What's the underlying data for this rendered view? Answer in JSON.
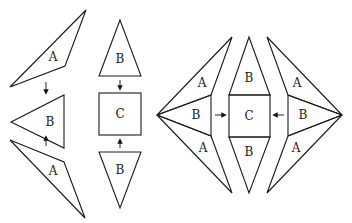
{
  "diagram": {
    "type": "quilt-block-assembly",
    "left_panel": {
      "column_1": [
        {
          "shape": "triangle",
          "label": "A"
        },
        {
          "arrow": "down"
        },
        {
          "shape": "triangle",
          "label": "B"
        },
        {
          "arrow": "up"
        },
        {
          "shape": "triangle",
          "label": "A"
        }
      ],
      "column_2": [
        {
          "shape": "triangle",
          "label": "B"
        },
        {
          "arrow": "down"
        },
        {
          "shape": "square",
          "label": "C"
        },
        {
          "arrow": "up"
        },
        {
          "shape": "triangle",
          "label": "B"
        }
      ]
    },
    "right_panel": {
      "left_unit": {
        "labels": [
          "A",
          "B",
          "A"
        ]
      },
      "center_unit": {
        "labels": [
          "B",
          "C",
          "B"
        ]
      },
      "right_unit": {
        "labels": [
          "A",
          "B",
          "A"
        ]
      },
      "arrows": [
        "right",
        "left"
      ]
    },
    "labels": {
      "l_a1": "A",
      "l_b1": "B",
      "l_a2": "A",
      "m_b1": "B",
      "m_c": "C",
      "m_b2": "B",
      "r_a1": "A",
      "r_b1": "B",
      "r_a2": "A",
      "c_b1": "B",
      "c_c": "C",
      "c_b2": "B",
      "rr_a1": "A",
      "rr_b1": "B",
      "rr_a2": "A"
    }
  }
}
